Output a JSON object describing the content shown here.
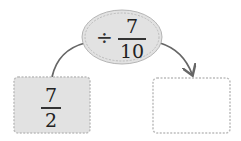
{
  "operator": {
    "symbol": "÷",
    "numerator": "7",
    "denominator": "10"
  },
  "input": {
    "numerator": "7",
    "denominator": "2"
  },
  "output": {
    "value": ""
  },
  "colors": {
    "fill": "#e2e2e2",
    "border": "#b0b0b0",
    "arrow": "#666666"
  }
}
